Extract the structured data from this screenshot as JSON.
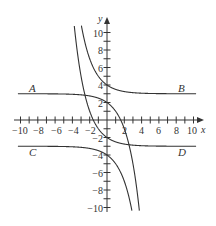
{
  "chart_data": {
    "type": "line",
    "title": "",
    "xlabel": "x",
    "ylabel": "y",
    "xlim": [
      -10,
      10
    ],
    "ylim": [
      -10,
      10
    ],
    "grid": false,
    "x_ticks": [
      -10,
      -8,
      -6,
      -4,
      -2,
      2,
      4,
      6,
      8,
      10
    ],
    "y_ticks": [
      10,
      8,
      6,
      4,
      2,
      -2,
      -4,
      -6,
      -8,
      -10
    ],
    "x_tick_labels": [
      "−10",
      "−8",
      "−6",
      "−4",
      "−2",
      "2",
      "4",
      "6",
      "8",
      "10"
    ],
    "y_tick_labels": [
      "10",
      "8",
      "6",
      "4",
      "2",
      "−2",
      "−4",
      "−6",
      "−8",
      "−10"
    ],
    "series": [
      {
        "name": "A",
        "description": "approaches y=3 as x→−∞, passes (0,2), decreases steeply",
        "formula": "y = 3 - 2^x",
        "points": [
          [
            -10,
            3.0
          ],
          [
            -4,
            2.94
          ],
          [
            -2,
            2.75
          ],
          [
            0,
            2
          ],
          [
            1,
            1
          ],
          [
            2,
            -1
          ],
          [
            3,
            -5
          ],
          [
            3.6,
            -9.1
          ]
        ]
      },
      {
        "name": "B",
        "description": "approaches y=3 as x→∞, passes (0,4), rises steeply to the left",
        "formula": "y = 3 + (1/2)^x",
        "points": [
          [
            -3,
            11
          ],
          [
            -2,
            7
          ],
          [
            -1,
            5
          ],
          [
            0,
            4
          ],
          [
            2,
            3.25
          ],
          [
            4,
            3.06
          ],
          [
            10,
            3.0
          ]
        ]
      },
      {
        "name": "C",
        "description": "approaches y=−3 as x→−∞, passes (0,−4), decreases steeply",
        "formula": "y = -3 - 2^x",
        "points": [
          [
            -10,
            -3.0
          ],
          [
            -4,
            -3.06
          ],
          [
            -2,
            -3.25
          ],
          [
            0,
            -4
          ],
          [
            1,
            -5
          ],
          [
            2,
            -7
          ],
          [
            2.8,
            -10
          ]
        ]
      },
      {
        "name": "D",
        "description": "approaches y=−3 as x→∞, passes (0,−2), rises steeply to the left",
        "formula": "y = -3 + (1/2)^x",
        "points": [
          [
            -3.7,
            10
          ],
          [
            -3,
            5
          ],
          [
            -2,
            1
          ],
          [
            -1,
            -1
          ],
          [
            0,
            -2
          ],
          [
            2,
            -2.75
          ],
          [
            4,
            -2.94
          ],
          [
            10,
            -3.0
          ]
        ]
      }
    ],
    "annotations": [
      "A",
      "B",
      "C",
      "D"
    ]
  },
  "labels": {
    "x_axis": "x",
    "y_axis": "y",
    "curve_a": "A",
    "curve_b": "B",
    "curve_c": "C",
    "curve_d": "D",
    "xt": [
      "−10",
      "−8",
      "−6",
      "−4",
      "−2",
      "2",
      "4",
      "6",
      "8",
      "10"
    ],
    "yt": [
      "10",
      "8",
      "6",
      "4",
      "2",
      "−2",
      "−4",
      "−6",
      "−8",
      "−10"
    ]
  }
}
